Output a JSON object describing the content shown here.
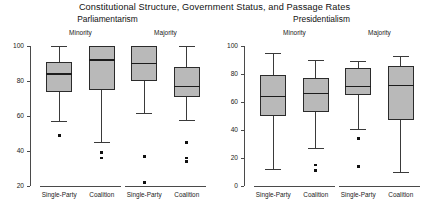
{
  "chart_data": {
    "type": "box",
    "title": "Constitutional Structure, Government Status, and Passage Rates",
    "xlabel": "",
    "ylabel": "",
    "grid": false,
    "legend": false,
    "panels": [
      {
        "name": "Parliamentarism",
        "ylim": [
          20,
          100
        ],
        "yticks": [
          20,
          40,
          60,
          80,
          100
        ],
        "ytick_labels": [
          "20",
          "40",
          "60",
          "80",
          "100"
        ],
        "groups": [
          {
            "label": "Minority",
            "boxes": [
              {
                "category": "Single-Party",
                "whisker_low": 57,
                "q1": 74,
                "median": 84,
                "q3": 91,
                "whisker_high": 100,
                "outliers": [
                  49
                ]
              },
              {
                "category": "Coalition",
                "whisker_low": 45,
                "q1": 75,
                "median": 92,
                "q3": 100,
                "whisker_high": 100,
                "outliers": [
                  39,
                  36
                ]
              }
            ]
          },
          {
            "label": "Majority",
            "boxes": [
              {
                "category": "Single-Party",
                "whisker_low": 62,
                "q1": 80,
                "median": 90,
                "q3": 100,
                "whisker_high": 100,
                "outliers": [
                  37,
                  22
                ]
              },
              {
                "category": "Coalition",
                "whisker_low": 58,
                "q1": 71,
                "median": 77,
                "q3": 88,
                "whisker_high": 100,
                "outliers": [
                  45,
                  36,
                  34
                ]
              }
            ]
          }
        ]
      },
      {
        "name": "Presidentialism",
        "ylim": [
          0,
          100
        ],
        "yticks": [
          0,
          20,
          40,
          60,
          80,
          100
        ],
        "ytick_labels": [
          "0",
          "20",
          "40",
          "60",
          "80",
          "100"
        ],
        "groups": [
          {
            "label": "Minority",
            "boxes": [
              {
                "category": "Single-Party",
                "whisker_low": 12,
                "q1": 50,
                "median": 64,
                "q3": 79,
                "whisker_high": 95,
                "outliers": []
              },
              {
                "category": "Coalition",
                "whisker_low": 27,
                "q1": 53,
                "median": 66,
                "q3": 77,
                "whisker_high": 90,
                "outliers": [
                  15,
                  11
                ]
              }
            ]
          },
          {
            "label": "Majority",
            "boxes": [
              {
                "category": "Single-Party",
                "whisker_low": 41,
                "q1": 65,
                "median": 71,
                "q3": 84,
                "whisker_high": 89,
                "outliers": [
                  34,
                  14
                ]
              },
              {
                "category": "Coalition",
                "whisker_low": 10,
                "q1": 47,
                "median": 72,
                "q3": 86,
                "whisker_high": 93,
                "outliers": []
              }
            ]
          }
        ]
      }
    ],
    "colors": {
      "box_fill": "#b9b9b9",
      "box_border": "#2b2b2b",
      "median": "#1c1c1c",
      "whisker": "#3a3a3a",
      "outlier": "#111111",
      "axis": "#4a4a4a",
      "background": "#ffffff"
    }
  }
}
